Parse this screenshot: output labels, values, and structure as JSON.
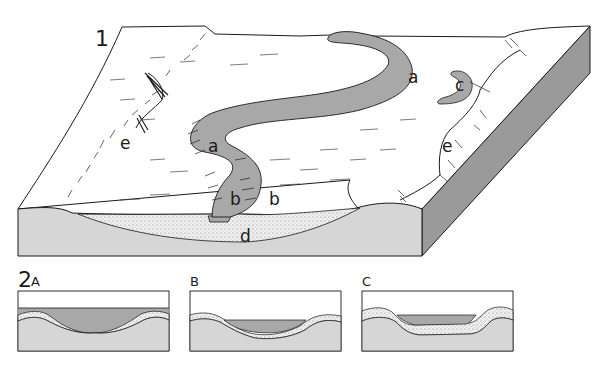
{
  "figure": {
    "block_diagram": {
      "number": "1",
      "labels": {
        "meander_1": "a",
        "meander_2": "a",
        "bank_left": "b",
        "bank_right": "b",
        "oxbow": "c",
        "deposit": "d",
        "valley_edge_left": "e",
        "valley_edge_right": "e"
      }
    },
    "cross_sections": {
      "number": "2",
      "panels": [
        {
          "label": "A"
        },
        {
          "label": "B"
        },
        {
          "label": "C"
        }
      ]
    },
    "colors": {
      "water": "#a8a8a8",
      "ground": "#d6d6d6",
      "surface": "#ffffff",
      "side_face": "#999999",
      "deposit": "#e4e4e4",
      "line": "#1a1a1a"
    }
  }
}
